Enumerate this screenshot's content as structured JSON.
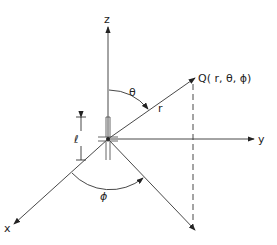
{
  "diagram": {
    "axes": {
      "z": "z",
      "y": "y",
      "x": "x"
    },
    "point_label": "Q( r, θ, ϕ)",
    "radius_label": "r",
    "theta_label": "θ",
    "phi_label": "ϕ",
    "dipole_length_label": "ℓ"
  }
}
